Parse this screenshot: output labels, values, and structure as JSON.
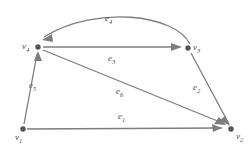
{
  "figure": {
    "background_color": "#ffffff",
    "edge_color": "#7d7d7d",
    "vertex_color": "#555555",
    "label_color": "#4a4a4a"
  },
  "vertices": [
    {
      "id": "v1",
      "base": "v",
      "sub": "1",
      "x": 23,
      "y": 129,
      "label_x": 15,
      "label_y": 133
    },
    {
      "id": "v2",
      "base": "v",
      "sub": "2",
      "x": 231,
      "y": 129,
      "label_x": 236,
      "label_y": 132
    },
    {
      "id": "v3",
      "base": "v",
      "sub": "3",
      "x": 188,
      "y": 48,
      "label_x": 193,
      "label_y": 43
    },
    {
      "id": "v4",
      "base": "v",
      "sub": "4",
      "x": 38,
      "y": 47,
      "label_x": 22,
      "label_y": 42
    }
  ],
  "edges": [
    {
      "id": "e1",
      "base": "e",
      "sub": "1",
      "from": "v1",
      "to": "v2",
      "shape": "straight",
      "label_x": 118,
      "label_y": 112
    },
    {
      "id": "e2",
      "base": "e",
      "sub": "2",
      "from": "v3",
      "to": "v2",
      "shape": "straight",
      "label_x": 193,
      "label_y": 83
    },
    {
      "id": "e3",
      "base": "e",
      "sub": "3",
      "from": "v4",
      "to": "v3",
      "shape": "straight",
      "label_x": 108,
      "label_y": 54
    },
    {
      "id": "e4",
      "base": "e",
      "sub": "4",
      "from": "v3",
      "to": "v4",
      "shape": "curved-arc",
      "label_x": 105,
      "label_y": 14
    },
    {
      "id": "e5",
      "base": "e",
      "sub": "5",
      "from": "v1",
      "to": "v4",
      "shape": "straight",
      "label_x": 29,
      "label_y": 81
    },
    {
      "id": "e6",
      "base": "e",
      "sub": "6",
      "from": "v4",
      "to": "v2",
      "shape": "straight",
      "label_x": 116,
      "label_y": 87
    }
  ],
  "geometry": {
    "e1_path": "M 27 129 L 222 128",
    "e2_path": "M 191 53 L 229 124",
    "e3_path": "M 43 47 L 180 47",
    "e4_path": "M 190 44 C 175 14, 95 5, 44 37",
    "e5_path": "M 24 124 L 37 54",
    "e6_path": "M 43 50 L 225 124",
    "e1_arrow": "222,128 212,124 213,132",
    "e2_arrow": "230,126 220,120 225,116",
    "e3_arrow": "182,47 171,43 171,51",
    "e4_arrow": "42,40 52,34 53,42",
    "e5_arrow": "38,51 34,61 42,61",
    "e6_arrow": "226,125 214,124 219,117"
  }
}
